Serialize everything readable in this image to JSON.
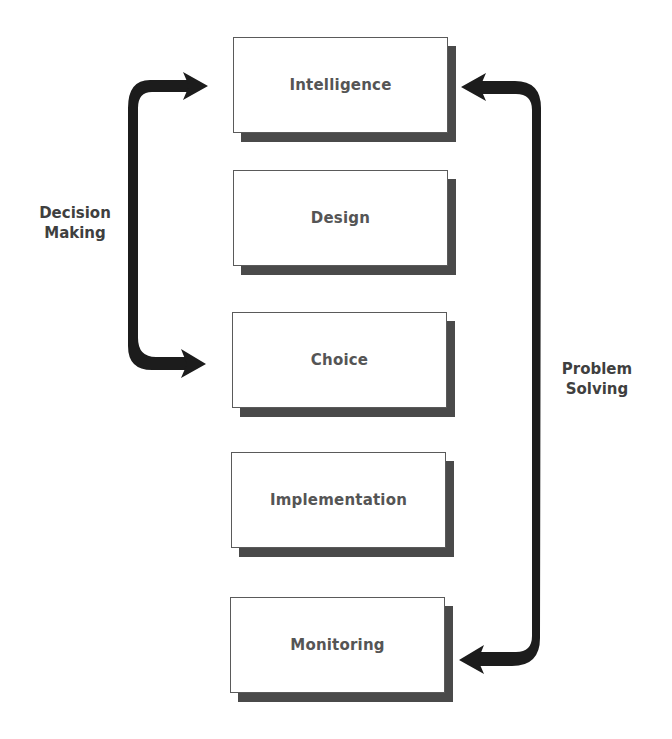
{
  "diagram": {
    "stages": [
      {
        "label": "Intelligence"
      },
      {
        "label": "Design"
      },
      {
        "label": "Choice"
      },
      {
        "label": "Implementation"
      },
      {
        "label": "Monitoring"
      }
    ],
    "brackets": {
      "left": {
        "line1": "Decision",
        "line2": "Making",
        "spans": "Intelligence to Choice"
      },
      "right": {
        "line1": "Problem",
        "line2": "Solving",
        "spans": "Intelligence to Monitoring"
      }
    },
    "colors": {
      "box_border": "#5a5a5a",
      "box_shadow": "#4a4a4a",
      "label_text": "#555555",
      "arrow": "#1c1c1c",
      "side_text": "#3f3f3f"
    }
  }
}
